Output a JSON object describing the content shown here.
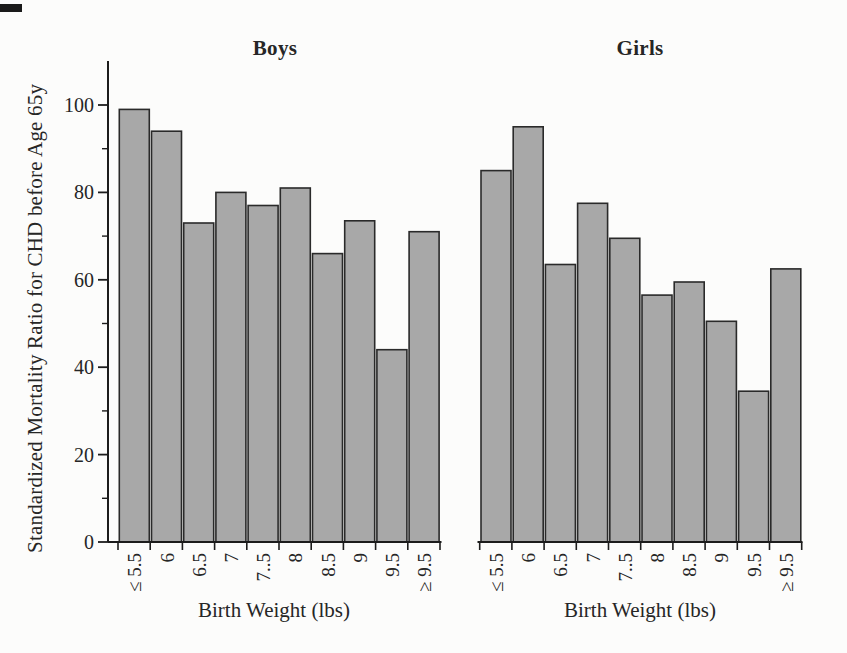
{
  "chart_data": {
    "type": "bar",
    "title": "",
    "xlabel": "Birth Weight (lbs)",
    "ylabel": "Standardized Mortality Ratio for CHD before Age 65y",
    "ylim": [
      0,
      110
    ],
    "yticks": [
      0,
      20,
      40,
      60,
      80,
      100
    ],
    "yticks_minor": [
      10,
      30,
      50,
      70,
      90
    ],
    "grid": "off",
    "legend": "none",
    "categories": [
      "≤ 5.5",
      "6",
      "6.5",
      "7",
      "7..5",
      "8",
      "8.5",
      "9",
      "9.5",
      "≥ 9.5"
    ],
    "panels": [
      {
        "title": "Boys",
        "values": [
          99,
          94,
          73,
          80,
          77,
          81,
          66,
          73.5,
          44,
          71
        ]
      },
      {
        "title": "Girls",
        "values": [
          85,
          95,
          63.5,
          77.5,
          69.5,
          56.5,
          59.5,
          50.5,
          34.5,
          62.5
        ]
      }
    ],
    "bar_fill": "#a8a8a8",
    "bar_border": "#2a2a2a",
    "axis_color": "#1c1c1c",
    "text_color": "#262626"
  }
}
